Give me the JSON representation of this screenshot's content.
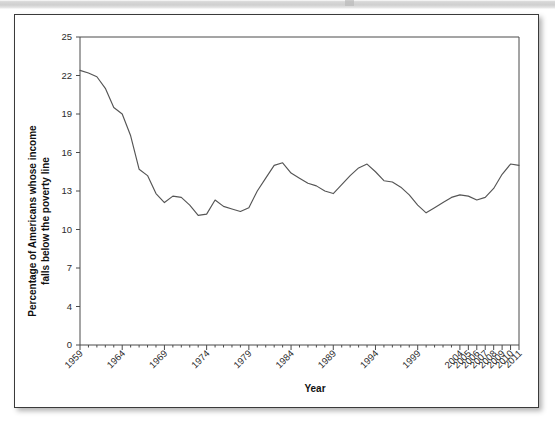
{
  "figure": {
    "chart_type": "line",
    "xlabel": "Year",
    "ylabel_line1": "Percentage of Americans whose income",
    "ylabel_line2": "falls below the poverty line",
    "line_color": "#555555",
    "axis_color": "#4a4a4a",
    "card_border_color": "#3a3a3a",
    "background_color": "#ffffff"
  },
  "chart_data": {
    "type": "line",
    "title": "",
    "subtitle": "",
    "xlabel": "Year",
    "ylabel": "Percentage of Americans whose income falls below the poverty line",
    "xlim": [
      1959,
      2011
    ],
    "ylim": [
      0,
      25
    ],
    "grid": false,
    "legend": false,
    "legend_position": "none",
    "y_ticks": [
      0,
      4,
      7,
      10,
      13,
      16,
      19,
      22,
      25
    ],
    "x_tick_labels": [
      "1959",
      "1964",
      "1969",
      "1974",
      "1979",
      "1984",
      "1989",
      "1994",
      "1999",
      "2004",
      "2005",
      "2006",
      "2007",
      "2008",
      "2009",
      "2010",
      "2011"
    ],
    "x_tick_values": [
      1959,
      1964,
      1969,
      1974,
      1979,
      1984,
      1989,
      1994,
      1999,
      2004,
      2005,
      2006,
      2007,
      2008,
      2009,
      2010,
      2011
    ],
    "x_minor_ticks": [
      1960,
      1961,
      1962,
      1963,
      1965,
      1966,
      1967,
      1968,
      1970,
      1971,
      1972,
      1973,
      1975,
      1976,
      1977,
      1978,
      1980,
      1981,
      1982,
      1983,
      1985,
      1986,
      1987,
      1988,
      1990,
      1991,
      1992,
      1993,
      1995,
      1996,
      1997,
      1998,
      2000,
      2001,
      2002,
      2003
    ],
    "series": [
      {
        "name": "Poverty rate",
        "x": [
          1959,
          1960,
          1961,
          1962,
          1963,
          1964,
          1965,
          1966,
          1967,
          1968,
          1969,
          1970,
          1971,
          1972,
          1973,
          1974,
          1975,
          1976,
          1977,
          1978,
          1979,
          1980,
          1981,
          1982,
          1983,
          1984,
          1985,
          1986,
          1987,
          1988,
          1989,
          1990,
          1991,
          1992,
          1993,
          1994,
          1995,
          1996,
          1997,
          1998,
          1999,
          2000,
          2001,
          2002,
          2003,
          2004,
          2005,
          2006,
          2007,
          2008,
          2009,
          2010,
          2011
        ],
        "values": [
          22.4,
          22.2,
          21.9,
          21.0,
          19.5,
          19.0,
          17.3,
          14.7,
          14.2,
          12.8,
          12.1,
          12.6,
          12.5,
          11.9,
          11.1,
          11.2,
          12.3,
          11.8,
          11.6,
          11.4,
          11.7,
          13.0,
          14.0,
          15.0,
          15.2,
          14.4,
          14.0,
          13.6,
          13.4,
          13.0,
          12.8,
          13.5,
          14.2,
          14.8,
          15.1,
          14.5,
          13.8,
          13.7,
          13.3,
          12.7,
          11.9,
          11.3,
          11.7,
          12.1,
          12.5,
          12.7,
          12.6,
          12.3,
          12.5,
          13.2,
          14.3,
          15.1,
          15.0
        ]
      }
    ]
  }
}
